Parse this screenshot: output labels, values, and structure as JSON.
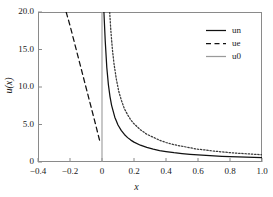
{
  "chart_data": {
    "type": "line",
    "title": "",
    "xlabel": "x",
    "ylabel": "u(x)",
    "xlim": [
      -0.4,
      1.0
    ],
    "ylim": [
      0.0,
      20.0
    ],
    "grid": false,
    "legend_position": "top-right",
    "xticks": [
      -0.4,
      -0.2,
      0.0,
      0.2,
      0.4,
      0.6,
      0.8,
      1.0
    ],
    "xtick_labels": [
      "−0.4",
      "−0.2",
      "0",
      "0.2",
      "0.4",
      "0.6",
      "0.8",
      "1.0"
    ],
    "yticks": [
      0.0,
      5.0,
      10.0,
      15.0,
      20.0
    ],
    "ytick_labels": [
      "0",
      "5.0",
      "10.0",
      "15.0",
      "20.0"
    ],
    "series": [
      {
        "name": "un",
        "style": "solid",
        "color": "#111111",
        "x": [
          0.012,
          0.02,
          0.03,
          0.04,
          0.05,
          0.06,
          0.08,
          0.1,
          0.12,
          0.14,
          0.16,
          0.18,
          0.2,
          0.24,
          0.28,
          0.32,
          0.36,
          0.4,
          0.45,
          0.5,
          0.55,
          0.6,
          0.65,
          0.7,
          0.75,
          0.8,
          0.85,
          0.9,
          0.95,
          1.0
        ],
        "y": [
          20.0,
          16.2,
          12.6,
          10.3,
          8.72,
          7.56,
          5.98,
          4.94,
          4.21,
          3.67,
          3.25,
          2.92,
          2.65,
          2.24,
          1.94,
          1.71,
          1.53,
          1.39,
          1.24,
          1.12,
          1.02,
          0.94,
          0.87,
          0.81,
          0.76,
          0.71,
          0.67,
          0.64,
          0.61,
          0.58
        ]
      },
      {
        "name": "ue",
        "style": "dashed",
        "color": "#111111",
        "x": [
          -0.224,
          -0.2,
          -0.16,
          -0.12,
          -0.08,
          -0.04,
          -0.02,
          -0.012
        ],
        "y": [
          20.0,
          18.2,
          14.9,
          11.6,
          8.3,
          5.0,
          3.3,
          2.6
        ]
      },
      {
        "name": "u0",
        "style": "solid",
        "color": "#9a9a9a",
        "x": [
          0.0,
          0.0
        ],
        "y": [
          0.0,
          20.0
        ]
      },
      {
        "name": "u0-branch",
        "style": "dotted",
        "color": "#3a3a3a",
        "x": [
          0.048,
          0.055,
          0.065,
          0.075,
          0.09,
          0.105,
          0.12,
          0.14,
          0.16,
          0.18,
          0.2,
          0.24,
          0.28,
          0.32,
          0.36,
          0.4,
          0.45,
          0.5,
          0.55,
          0.6,
          0.65,
          0.7,
          0.75,
          0.8,
          0.85,
          0.9,
          0.95,
          1.0
        ],
        "y": [
          20.0,
          17.6,
          15.0,
          13.1,
          11.0,
          9.4,
          8.3,
          7.1,
          6.3,
          5.6,
          5.1,
          4.3,
          3.7,
          3.3,
          2.9,
          2.6,
          2.3,
          2.1,
          1.9,
          1.7,
          1.6,
          1.45,
          1.35,
          1.25,
          1.17,
          1.1,
          1.03,
          0.98
        ]
      }
    ],
    "legend": [
      {
        "label": "un",
        "style": "solid",
        "color": "#111111"
      },
      {
        "label": "ue",
        "style": "dashed",
        "color": "#111111"
      },
      {
        "label": "u0",
        "style": "solid",
        "color": "#9a9a9a"
      }
    ]
  }
}
